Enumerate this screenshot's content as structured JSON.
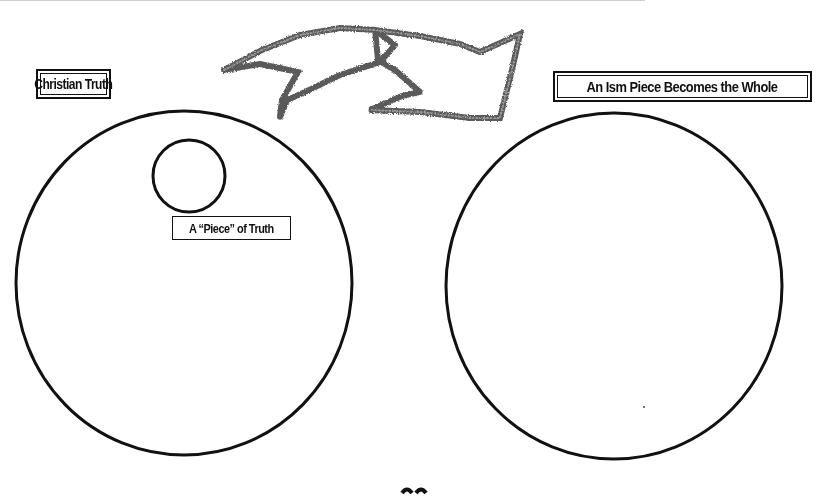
{
  "diagram": {
    "type": "concept-illustration",
    "left_panel": {
      "label": "Christian Truth",
      "shape": "large-circle",
      "inner": {
        "shape": "small-circle",
        "label": "A “Piece” of Truth"
      }
    },
    "right_panel": {
      "label": "An Ism Piece Becomes the Whole",
      "shape": "large-circle"
    },
    "connector": {
      "shape": "double-chevron-arrow",
      "direction": "left-to-right",
      "style": "textured-grey-outline"
    }
  },
  "colors": {
    "background": "#ffffff",
    "ink": "#111111",
    "arrow_stroke": "#6e6e6e"
  }
}
